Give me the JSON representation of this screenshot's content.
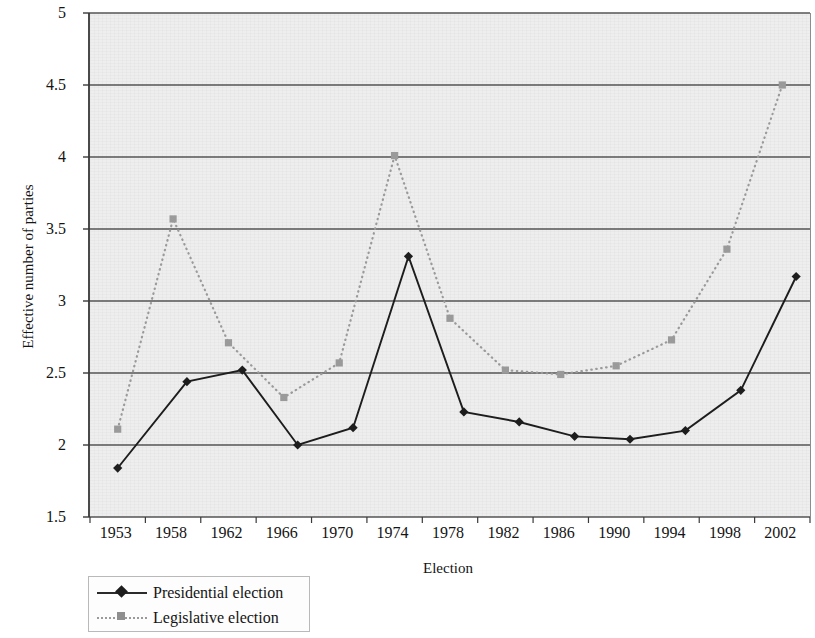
{
  "chart_data": {
    "type": "line",
    "title": "",
    "xlabel": "Election",
    "ylabel": "Effective number of parties",
    "ylim": [
      1.5,
      5
    ],
    "ytick_labels": [
      "5",
      "4.5",
      "4",
      "3.5",
      "3",
      "2.5",
      "2",
      "1.5"
    ],
    "ytick_values": [
      5,
      4.5,
      4,
      3.5,
      3,
      2.5,
      2,
      1.5
    ],
    "grid": true,
    "grid_axis": "y",
    "legend_position": "below-left",
    "categories": [
      "1953",
      "1958",
      "1962",
      "1966",
      "1970",
      "1974",
      "1978",
      "1982",
      "1986",
      "1990",
      "1994",
      "1998",
      "2002"
    ],
    "series": [
      {
        "name": "Presidential election",
        "color": "#1d1d1d",
        "line_style": "solid",
        "marker": "diamond",
        "points": [
          {
            "x": 1953,
            "y": 1.84
          },
          {
            "x": 1958,
            "y": 2.44
          },
          {
            "x": 1962,
            "y": 2.52
          },
          {
            "x": 1966,
            "y": 2.0
          },
          {
            "x": 1970,
            "y": 2.12
          },
          {
            "x": 1974,
            "y": 3.31
          },
          {
            "x": 1978,
            "y": 2.23
          },
          {
            "x": 1982,
            "y": 2.16
          },
          {
            "x": 1986,
            "y": 2.06
          },
          {
            "x": 1990,
            "y": 2.04
          },
          {
            "x": 1994,
            "y": 2.1
          },
          {
            "x": 1998,
            "y": 2.38
          },
          {
            "x": 2002,
            "y": 3.17
          }
        ]
      },
      {
        "name": "Legislative election",
        "color": "#9a9a9a",
        "line_style": "dotted",
        "marker": "square",
        "points": [
          {
            "x": 1953,
            "y": 2.11
          },
          {
            "x": 1957,
            "y": 3.57
          },
          {
            "x": 1961,
            "y": 2.71
          },
          {
            "x": 1965,
            "y": 2.33
          },
          {
            "x": 1969,
            "y": 2.57
          },
          {
            "x": 1973,
            "y": 4.01
          },
          {
            "x": 1977,
            "y": 2.88
          },
          {
            "x": 1981,
            "y": 2.52
          },
          {
            "x": 1985,
            "y": 2.49
          },
          {
            "x": 1989,
            "y": 2.55
          },
          {
            "x": 1993,
            "y": 2.73
          },
          {
            "x": 1997,
            "y": 3.36
          },
          {
            "x": 2001,
            "y": 4.5
          }
        ]
      }
    ]
  },
  "legend": {
    "items": [
      {
        "label": "Presidential election"
      },
      {
        "label": "Legislative election"
      }
    ]
  }
}
